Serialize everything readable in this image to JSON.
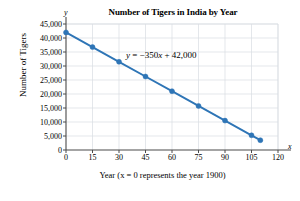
{
  "chart_data": {
    "type": "line",
    "title": "Number of Tigers in India by Year",
    "xlabel": "Year (x = 0 represents the year 1900)",
    "ylabel": "Number of Tigers",
    "x_axis_letter": "y",
    "y_axis_letter": "x",
    "annotation": "y = −350x + 42,000",
    "annotation_parts": {
      "lhs": "y",
      "equals": " = ",
      "slope": "−350",
      "var": "x",
      "plus": " + ",
      "intercept": "42,000"
    },
    "xlim": [
      0,
      120
    ],
    "ylim": [
      0,
      45000
    ],
    "grid": true,
    "legend": "none",
    "xticks": [
      0,
      15,
      30,
      45,
      60,
      75,
      90,
      105,
      120
    ],
    "xtick_labels": [
      "0",
      "15",
      "30",
      "45",
      "60",
      "75",
      "90",
      "105",
      "120"
    ],
    "yticks": [
      0,
      5000,
      10000,
      15000,
      20000,
      25000,
      30000,
      35000,
      40000,
      45000
    ],
    "ytick_labels": [
      "0",
      "5,000",
      "10,000",
      "15,000",
      "20,000",
      "25,000",
      "30,000",
      "35,000",
      "40,000",
      "45,000"
    ],
    "x": [
      0,
      15,
      30,
      45,
      60,
      75,
      90,
      105,
      110
    ],
    "values": [
      42000,
      36750,
      31500,
      26250,
      21000,
      15750,
      10500,
      5250,
      3500
    ],
    "series": [
      {
        "name": "Number of Tigers",
        "x": [
          0,
          15,
          30,
          45,
          60,
          75,
          90,
          105,
          110
        ],
        "values": [
          42000,
          36750,
          31500,
          26250,
          21000,
          15750,
          10500,
          5250,
          3500
        ]
      }
    ],
    "colors": {
      "line": "#2e75b6",
      "marker": "#2e75b6",
      "grid": "#d9dde3",
      "axis": "#4a4a4a",
      "text": "#000000",
      "background": "#ffffff"
    }
  }
}
